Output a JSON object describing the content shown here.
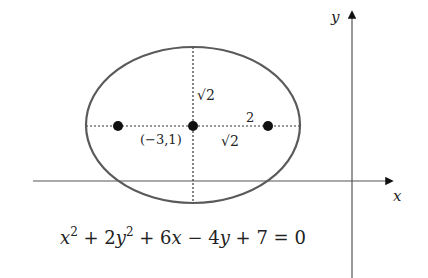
{
  "diagram": {
    "axes": {
      "x_label": "x",
      "y_label": "y"
    },
    "ellipse": {
      "center_label": "(−3,1)",
      "semi_minor_label": "√2",
      "focal_distance_label": "√2",
      "semi_major_label": "2",
      "stroke_color": "#5a5a5a"
    },
    "equation": {
      "x2": "x",
      "exp1": "2",
      "plus1": " + 2",
      "y2": "y",
      "exp2": "2",
      "plus6x": " + 6",
      "x": "x",
      "minus4": " − 4",
      "y": "y",
      "rest": " + 7 = 0"
    },
    "colors": {
      "axis": "#555555",
      "dots": "#111111",
      "dotted": "#333333"
    }
  }
}
